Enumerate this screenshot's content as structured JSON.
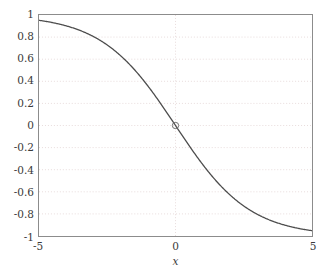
{
  "chart_data": {
    "type": "line",
    "title": "",
    "subtitle": "",
    "xlabel": "x",
    "ylabel": "",
    "xlim": [
      -5,
      5
    ],
    "ylim": [
      -1,
      1
    ],
    "grid": true,
    "grid_style": "dotted",
    "grid_color": "#e8dcdc",
    "legend": "none",
    "axis_color": "#8c8c8c",
    "tick_label_color": "#3a3a3a",
    "line_color": "#4d4d4d",
    "line_width": 1.3,
    "background": "#ffffff",
    "xticks": [
      -5,
      0,
      5
    ],
    "xtick_labels": [
      "-5",
      "0",
      "5"
    ],
    "yticks": [
      1,
      0.8,
      0.6,
      0.4,
      0.2,
      0,
      -0.2,
      -0.4,
      -0.6,
      -0.8,
      -1
    ],
    "ytick_labels": [
      "1",
      "0.8",
      "0.6",
      "0.4",
      "0.2",
      "0",
      "-0.2",
      "-0.4",
      "-0.6",
      "-0.8",
      "-1"
    ],
    "series": [
      {
        "name": "sigmoid",
        "formula": "-tanh(0.37*x)",
        "x": [
          -5.0,
          -4.75,
          -4.5,
          -4.25,
          -4.0,
          -3.75,
          -3.5,
          -3.25,
          -3.0,
          -2.75,
          -2.5,
          -2.25,
          -2.0,
          -1.75,
          -1.5,
          -1.25,
          -1.0,
          -0.75,
          -0.5,
          -0.25,
          0.0,
          0.25,
          0.5,
          0.75,
          1.0,
          1.25,
          1.5,
          1.75,
          2.0,
          2.25,
          2.5,
          2.75,
          3.0,
          3.25,
          3.5,
          3.75,
          4.0,
          4.25,
          4.5,
          4.75,
          5.0
        ],
        "y": [
          0.959,
          0.952,
          0.944,
          0.935,
          0.924,
          0.912,
          0.898,
          0.881,
          0.862,
          0.839,
          0.813,
          0.782,
          0.747,
          0.706,
          0.659,
          0.606,
          0.546,
          0.479,
          0.406,
          0.328,
          0.0,
          -0.328,
          -0.406,
          -0.479,
          -0.546,
          -0.606,
          -0.659,
          -0.706,
          -0.747,
          -0.782,
          -0.813,
          -0.839,
          -0.862,
          -0.881,
          -0.898,
          -0.912,
          -0.924,
          -0.935,
          -0.944,
          -0.952,
          -0.959
        ]
      }
    ],
    "markers": [
      {
        "name": "origin-marker",
        "shape": "circle",
        "x": 0,
        "y": 0,
        "radius_px": 3.2,
        "color": "#6e6e6e",
        "filled": false
      }
    ]
  }
}
